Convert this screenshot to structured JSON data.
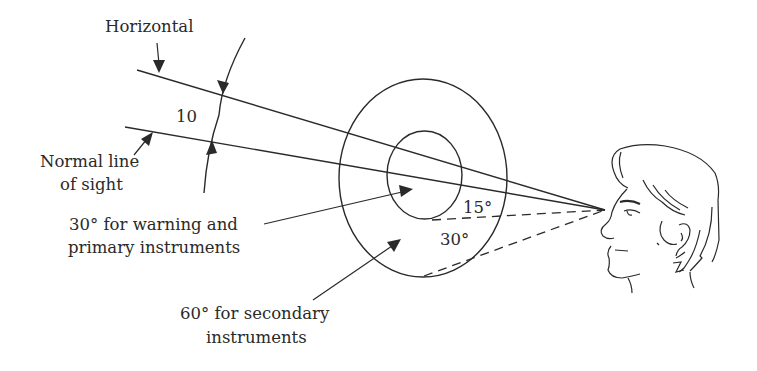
{
  "figure": {
    "labels": {
      "horizontal": "Horizontal",
      "normal_line_1": "Normal line",
      "normal_line_2": "of sight",
      "angle_between": "10",
      "primary_1": "30° for warning and",
      "primary_2": "primary instruments",
      "secondary_1": "60° for secondary",
      "secondary_2": "instruments",
      "inner_angle": "15°",
      "outer_angle": "30°"
    },
    "elements": {
      "inner_zone": "primary-zone-ellipse",
      "outer_zone": "secondary-zone-ellipse",
      "viewer": "human-head-profile"
    },
    "colors": {
      "ink": "#2a2a2a",
      "background": "#ffffff"
    }
  }
}
